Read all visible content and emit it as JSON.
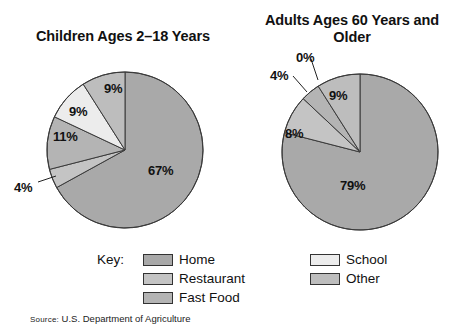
{
  "figure": {
    "source_prefix": "Source:",
    "source_text": " U.S. Department of Agriculture"
  },
  "legend": {
    "key_label": "Key:",
    "column_left": [
      {
        "label": "Home",
        "color": "#a9a9a9"
      },
      {
        "label": "Restaurant",
        "color": "#c4c4c4"
      },
      {
        "label": "Fast Food",
        "color": "#b4b4b4"
      }
    ],
    "column_right": [
      {
        "label": "School",
        "color": "#ececec"
      },
      {
        "label": "Other",
        "color": "#bdbdbd"
      }
    ]
  },
  "chart_data": [
    {
      "type": "pie",
      "title": "Children Ages 2–18 Years",
      "categories": [
        "Home",
        "Restaurant",
        "Fast Food",
        "School",
        "Other"
      ],
      "values": [
        67,
        4,
        11,
        9,
        9
      ],
      "labels": [
        "67%",
        "4%",
        "11%",
        "9%",
        "9%"
      ],
      "colors": [
        "#a9a9a9",
        "#c4c4c4",
        "#b4b4b4",
        "#ececec",
        "#bdbdbd"
      ],
      "unit": "percent",
      "legend_position": "bottom",
      "start_angle_deg": 0,
      "direction": "clockwise",
      "center": [
        125,
        150
      ],
      "radius": 78,
      "label_positions": [
        {
          "label": "67%",
          "x": 148,
          "y": 163,
          "leader": false
        },
        {
          "label": "4%",
          "x": 14,
          "y": 180,
          "leader": true,
          "leader_line": [
            38,
            182,
            56,
            176
          ]
        },
        {
          "label": "11%",
          "x": 53,
          "y": 129,
          "leader": false
        },
        {
          "label": "9%",
          "x": 69,
          "y": 104,
          "leader": false
        },
        {
          "label": "9%",
          "x": 104,
          "y": 81,
          "leader": false
        }
      ]
    },
    {
      "type": "pie",
      "title": "Adults Ages 60 Years and Older",
      "categories": [
        "Home",
        "Restaurant",
        "Fast Food",
        "School",
        "Other"
      ],
      "values": [
        79,
        8,
        4,
        0,
        9
      ],
      "labels": [
        "79%",
        "8%",
        "4%",
        "0%",
        "9%"
      ],
      "colors": [
        "#a9a9a9",
        "#c4c4c4",
        "#b4b4b4",
        "#ececec",
        "#bdbdbd"
      ],
      "unit": "percent",
      "legend_position": "bottom",
      "start_angle_deg": 0,
      "direction": "clockwise",
      "center": [
        360,
        152
      ],
      "radius": 78,
      "label_positions": [
        {
          "label": "79%",
          "x": 340,
          "y": 178,
          "leader": false
        },
        {
          "label": "8%",
          "x": 285,
          "y": 126,
          "leader": false
        },
        {
          "label": "4%",
          "x": 270,
          "y": 68,
          "leader": true,
          "leader_line": [
            293,
            76,
            307,
            92
          ]
        },
        {
          "label": "0%",
          "x": 296,
          "y": 50,
          "leader": true,
          "leader_line": [
            311,
            59,
            318,
            80
          ]
        },
        {
          "label": "9%",
          "x": 329,
          "y": 88,
          "leader": false
        }
      ]
    }
  ]
}
